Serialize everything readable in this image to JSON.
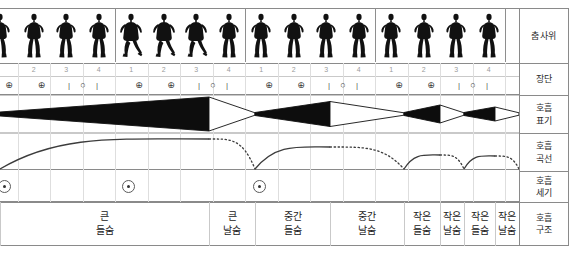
{
  "figure": {
    "row_labels": [
      {
        "key": "dance",
        "line1": "춤사위",
        "line2": ""
      },
      {
        "key": "rhythm",
        "line1": "장단",
        "line2": ""
      },
      {
        "key": "notation",
        "line1": "호흡",
        "line2": "표기"
      },
      {
        "key": "curve",
        "line1": "호흡",
        "line2": "곡선"
      },
      {
        "key": "strength",
        "line1": "호흡",
        "line2": "세기"
      },
      {
        "key": "structure",
        "line1": "호흡",
        "line2": "구조"
      }
    ]
  },
  "beats": {
    "numbers": [
      "2",
      "3",
      "4",
      "1",
      "2",
      "3",
      "4",
      "1",
      "2",
      "3",
      "4",
      "1",
      "2",
      "3",
      "4"
    ],
    "symbols": [
      "⊕",
      "⊕",
      "|",
      "○",
      "|",
      "⊕",
      "⊕",
      "|",
      "○",
      "|",
      "⊕",
      "⊕",
      "|",
      "○",
      "|",
      "⊕",
      "⊕",
      "|",
      "○",
      "|"
    ]
  },
  "rhythm_symbols": [
    {
      "sym": "⊕"
    },
    {
      "sym": "⊕"
    },
    {
      "sym": "|"
    },
    {
      "sym": "○"
    },
    {
      "sym": "|"
    },
    {
      "sym": "⊕"
    },
    {
      "sym": "⊕"
    },
    {
      "sym": "|"
    },
    {
      "sym": "○"
    },
    {
      "sym": "|"
    },
    {
      "sym": "⊕"
    },
    {
      "sym": "⊕"
    },
    {
      "sym": "|"
    },
    {
      "sym": "○"
    },
    {
      "sym": "|"
    },
    {
      "sym": "⊕"
    },
    {
      "sym": "⊕"
    },
    {
      "sym": "|"
    },
    {
      "sym": "○"
    },
    {
      "sym": "|"
    }
  ],
  "structure": [
    {
      "line1": "큰",
      "line2": "들숨"
    },
    {
      "line1": "큰",
      "line2": "날숨"
    },
    {
      "line1": "중간",
      "line2": "들숨"
    },
    {
      "line1": "중간",
      "line2": "날숨"
    },
    {
      "line1": "작은",
      "line2": "들숨"
    },
    {
      "line1": "작은",
      "line2": "날숨"
    },
    {
      "line1": "작은",
      "line2": "들숨"
    },
    {
      "line1": "작은",
      "line2": "날숨"
    }
  ],
  "chart_data": {
    "type": "area",
    "xlabel": "장단 (beats)",
    "ylabel": "호흡 세기",
    "notation_wedges": [
      {
        "type": "inhale",
        "fill": "solid",
        "x_start": 0,
        "x_end": 209,
        "label": "큰 들숨"
      },
      {
        "type": "exhale",
        "fill": "hollow",
        "x_start": 209,
        "x_end": 255,
        "label": "큰 날숨"
      },
      {
        "type": "inhale",
        "fill": "solid",
        "x_start": 255,
        "x_end": 330,
        "label": "중간 들숨"
      },
      {
        "type": "exhale",
        "fill": "hollow",
        "x_start": 330,
        "x_end": 404,
        "label": "중간 날숨"
      },
      {
        "type": "inhale",
        "fill": "solid",
        "x_start": 404,
        "x_end": 440,
        "label": "작은 들숨"
      },
      {
        "type": "exhale",
        "fill": "hollow",
        "x_start": 440,
        "x_end": 464,
        "label": "작은 날숨"
      },
      {
        "type": "inhale",
        "fill": "solid",
        "x_start": 464,
        "x_end": 495,
        "label": "작은 들숨"
      },
      {
        "type": "exhale",
        "fill": "hollow",
        "x_start": 495,
        "x_end": 519,
        "label": "작은 날숨"
      }
    ],
    "curve_arcs": [
      {
        "style": "solid",
        "x_start": 0,
        "x_end": 209,
        "peak_height": 30,
        "phase": "inhale"
      },
      {
        "style": "dotted",
        "x_start": 209,
        "x_end": 255,
        "peak_height": 30,
        "phase": "exhale"
      },
      {
        "style": "solid",
        "x_start": 255,
        "x_end": 330,
        "peak_height": 22,
        "phase": "inhale"
      },
      {
        "style": "dotted",
        "x_start": 330,
        "x_end": 404,
        "peak_height": 22,
        "phase": "exhale"
      },
      {
        "style": "solid",
        "x_start": 404,
        "x_end": 440,
        "peak_height": 14,
        "phase": "inhale"
      },
      {
        "style": "dotted",
        "x_start": 440,
        "x_end": 464,
        "peak_height": 14,
        "phase": "exhale"
      },
      {
        "style": "solid",
        "x_start": 464,
        "x_end": 495,
        "peak_height": 13,
        "phase": "inhale"
      },
      {
        "style": "dotted",
        "x_start": 495,
        "x_end": 519,
        "peak_height": 13,
        "phase": "exhale"
      }
    ],
    "strength_marks": [
      {
        "x": 4,
        "symbol": "⊙"
      },
      {
        "x": 128,
        "symbol": "⊙"
      },
      {
        "x": 259,
        "symbol": "⊙"
      }
    ],
    "grid": true,
    "legend": "none"
  },
  "colors": {
    "ink": "#1a1a1a",
    "grid_major": "#8e8e8e",
    "grid_minor": "#c9c9c9",
    "grid_light": "#dedede",
    "text": "#2b2b2b",
    "muted_text": "#9b9b9b"
  }
}
